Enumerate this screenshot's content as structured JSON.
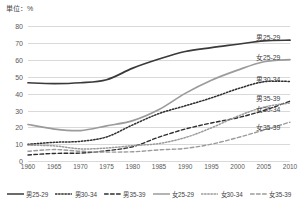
{
  "unit_label": "単位：%",
  "chart_data": {
    "type": "line",
    "title": "",
    "xlabel": "",
    "ylabel": "",
    "unit": "%",
    "x": [
      1960,
      1965,
      1970,
      1975,
      1980,
      1985,
      1990,
      1995,
      2000,
      2005,
      2010
    ],
    "xtick_labels": [
      "1960",
      "1965",
      "1970",
      "1975",
      "1980",
      "1985",
      "1990",
      "1995",
      "2000",
      "2005",
      "2010"
    ],
    "ytick_labels": [
      "0",
      "10",
      "20",
      "30",
      "40",
      "50",
      "60",
      "70",
      "80"
    ],
    "yticks": [
      0,
      10,
      20,
      30,
      40,
      50,
      60,
      70,
      80
    ],
    "ylim": [
      0,
      85
    ],
    "grid": true,
    "legend_position": "bottom",
    "series": [
      {
        "name": "男25-29",
        "style": "solid",
        "color": "#3a3a3a",
        "width": 1.7,
        "inline_label": "男25-29",
        "values": [
          46.5,
          46.0,
          46.5,
          48.3,
          55.2,
          60.6,
          65.1,
          67.4,
          69.4,
          71.4,
          71.8
        ]
      },
      {
        "name": "男30-34",
        "style": "dotted",
        "color": "#2e2e2e",
        "width": 1.5,
        "inline_label": "男30-34",
        "values": [
          9.9,
          11.1,
          11.7,
          14.3,
          21.5,
          28.2,
          32.8,
          37.5,
          42.9,
          47.1,
          47.3
        ]
      },
      {
        "name": "男35-39",
        "style": "dashed",
        "color": "#2e2e2e",
        "width": 1.4,
        "inline_label": "男35-39",
        "values": [
          3.6,
          4.5,
          4.7,
          6.1,
          8.5,
          14.2,
          19.0,
          22.6,
          25.7,
          30.0,
          35.6
        ]
      },
      {
        "name": "女25-29",
        "style": "solid",
        "color": "#9b9b9b",
        "width": 1.7,
        "inline_label": "女25-29",
        "values": [
          21.7,
          19.0,
          18.1,
          20.9,
          24.0,
          30.6,
          40.2,
          48.0,
          54.0,
          59.0,
          60.3
        ]
      },
      {
        "name": "女30-34",
        "style": "dotted",
        "color": "#9b9b9b",
        "width": 1.5,
        "inline_label": "女30-34",
        "values": [
          9.4,
          9.0,
          7.2,
          7.7,
          9.1,
          10.4,
          13.9,
          19.7,
          26.6,
          32.0,
          34.5
        ]
      },
      {
        "name": "女35-39",
        "style": "dashed",
        "color": "#9b9b9b",
        "width": 1.4,
        "inline_label": "女35-39",
        "values": [
          5.8,
          6.8,
          5.8,
          5.3,
          5.5,
          6.6,
          7.5,
          10.0,
          13.9,
          18.4,
          23.1
        ]
      }
    ],
    "inline_annotations": [
      {
        "text": "男25-29",
        "x": 2010,
        "y": 74.0
      },
      {
        "text": "女25-29",
        "x": 2010,
        "y": 62.0
      },
      {
        "text": "男30-34",
        "x": 2010,
        "y": 48.5
      },
      {
        "text": "男35-39",
        "x": 2010,
        "y": 37.5
      },
      {
        "text": "女30-34",
        "x": 2010,
        "y": 31.0
      },
      {
        "text": "女35-39",
        "x": 2010,
        "y": 20.5
      }
    ]
  },
  "legend": {
    "items": [
      {
        "label": "男25-29",
        "style": "solid",
        "color": "#3a3a3a"
      },
      {
        "label": "男30-34",
        "style": "dotted",
        "color": "#2e2e2e"
      },
      {
        "label": "男35-39",
        "style": "dashed",
        "color": "#2e2e2e"
      },
      {
        "label": "女25-29",
        "style": "solid",
        "color": "#9b9b9b"
      },
      {
        "label": "女30-34",
        "style": "dotted",
        "color": "#9b9b9b"
      },
      {
        "label": "女35-39",
        "style": "dashed",
        "color": "#9b9b9b"
      }
    ]
  }
}
